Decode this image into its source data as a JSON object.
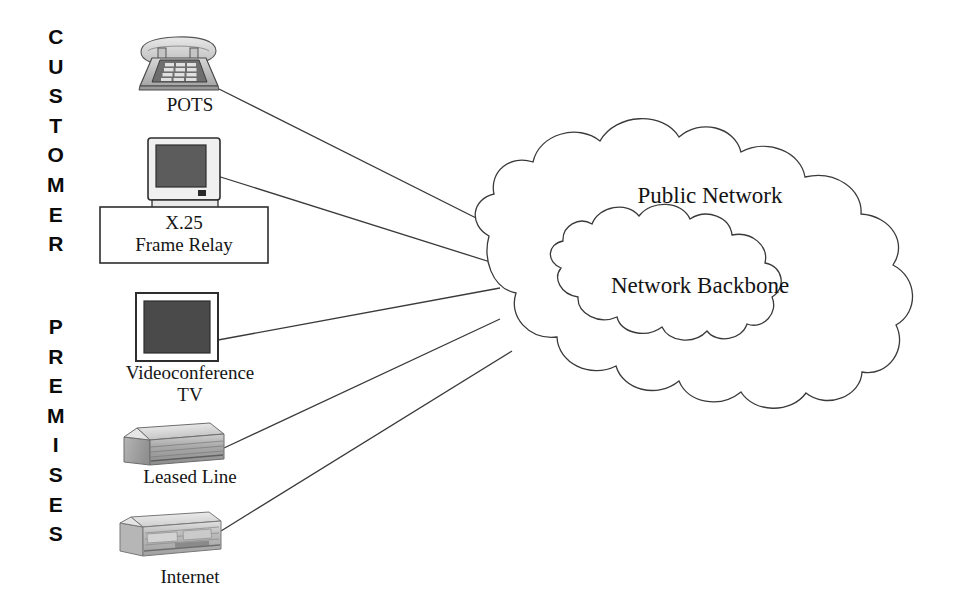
{
  "diagram": {
    "side_labels": {
      "customer": "C\nU\nS\nT\nO\nM\nE\nR",
      "premises": "P\nR\nE\nM\nI\nS\nE\nS"
    },
    "devices": [
      {
        "id": "pots",
        "icon": "telephone-icon",
        "label": "POTS"
      },
      {
        "id": "x25",
        "icon": "desktop-computer-icon",
        "label": "X.25\nFrame Relay"
      },
      {
        "id": "videotv",
        "icon": "television-icon",
        "label": "Videoconference\nTV"
      },
      {
        "id": "leased",
        "icon": "router-box-icon",
        "label": "Leased Line"
      },
      {
        "id": "internet",
        "icon": "rack-router-icon",
        "label": "Internet"
      }
    ],
    "clouds": {
      "outer": "Public Network",
      "inner": "Network Backbone"
    },
    "colors": {
      "stroke": "#3a3a3a",
      "ink": "#141414",
      "screen_dark": "#4a4a4a",
      "device_light": "#dcdcdc",
      "device_mid": "#b8b8b8",
      "device_shadow": "#8f8f8f",
      "background": "#ffffff"
    }
  }
}
